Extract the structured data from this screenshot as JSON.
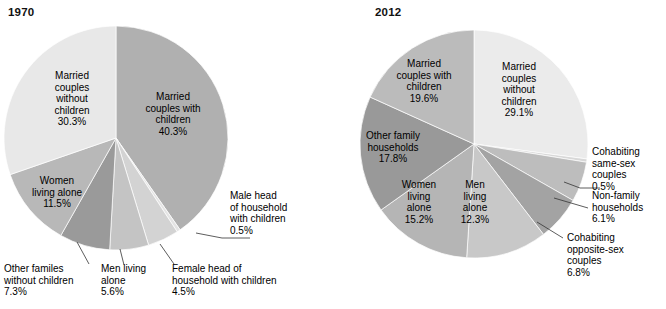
{
  "figure": {
    "background": "#ffffff",
    "text_color": "#000000"
  },
  "charts": [
    {
      "title": "1970",
      "title_pos": {
        "x": 8,
        "y": 16
      },
      "center": {
        "x": 116,
        "y": 138
      },
      "radius": 112,
      "start_angle_deg": -90
    },
    {
      "title": "2012",
      "title_pos": {
        "x": 375,
        "y": 16
      },
      "center": {
        "x": 474,
        "y": 144
      },
      "radius": 114,
      "start_angle_deg": -90
    }
  ],
  "chart_data": [
    {
      "type": "pie",
      "title": "1970",
      "unit": "%",
      "total": 100.0,
      "start_angle_deg": -90,
      "direction": "clockwise",
      "categories": [
        "Married couples with children",
        "Male head of household with children",
        "Female head of household with children",
        "Men living alone",
        "Other familes without children",
        "Women living alone",
        "Married couples without children"
      ],
      "values": [
        40.3,
        0.5,
        4.5,
        5.6,
        7.3,
        11.5,
        30.3
      ],
      "colors": [
        "#b0b0b0",
        "#e4e4e4",
        "#d3d3d3",
        "#c4c4c4",
        "#9a9a9a",
        "#b8b8b8",
        "#e8e8e8"
      ],
      "slices": [
        {
          "label": "Married couples with children",
          "value": 40.3,
          "value_text": "40.3%",
          "color": "#b0b0b0",
          "label_placement": "inside",
          "label_lines": [
            "Married",
            "couples with",
            "children",
            "40.3%"
          ],
          "label_pos": {
            "x": 173,
            "y": 100
          }
        },
        {
          "label": "Male head of household with children",
          "value": 0.5,
          "value_text": "0.5%",
          "color": "#e4e4e4",
          "label_placement": "outside",
          "label_lines": [
            "Male head",
            "of household",
            "with children",
            "0.5%"
          ],
          "label_pos": {
            "x": 230,
            "y": 199
          },
          "leader": [
            {
              "x": 196,
              "y": 233
            },
            {
              "x": 222,
              "y": 238
            },
            {
              "x": 250,
              "y": 238
            }
          ]
        },
        {
          "label": "Female head of household with children",
          "value": 4.5,
          "value_text": "4.5%",
          "color": "#d3d3d3",
          "label_placement": "outside",
          "label_lines": [
            "Female head of",
            "household with children",
            "4.5%"
          ],
          "label_pos": {
            "x": 172,
            "y": 272
          },
          "leader": [
            {
              "x": 160,
              "y": 244
            },
            {
              "x": 174,
              "y": 264
            }
          ]
        },
        {
          "label": "Men living alone",
          "value": 5.6,
          "value_text": "5.6%",
          "color": "#c4c4c4",
          "label_placement": "outside",
          "label_lines": [
            "Men living",
            "alone",
            "5.6%"
          ],
          "label_pos": {
            "x": 101,
            "y": 272
          },
          "leader": [
            {
              "x": 120,
              "y": 249
            },
            {
              "x": 124,
              "y": 265
            }
          ]
        },
        {
          "label": "Other familes without children",
          "value": 7.3,
          "value_text": "7.3%",
          "color": "#9a9a9a",
          "label_placement": "outside",
          "label_lines": [
            "Other familes",
            "without children",
            "7.3%"
          ],
          "label_pos": {
            "x": 4,
            "y": 272
          },
          "leader": [
            {
              "x": 77,
              "y": 242
            },
            {
              "x": 89,
              "y": 264
            }
          ]
        },
        {
          "label": "Women living alone",
          "value": 11.5,
          "value_text": "11.5%",
          "color": "#b8b8b8",
          "label_placement": "inside",
          "label_lines": [
            "Women",
            "living alone",
            "11.5%"
          ],
          "label_pos": {
            "x": 57,
            "y": 184
          }
        },
        {
          "label": "Married couples without children",
          "value": 30.3,
          "value_text": "30.3%",
          "color": "#e8e8e8",
          "label_placement": "inside",
          "label_lines": [
            "Married",
            "couples",
            "without",
            "children",
            "30.3%"
          ],
          "label_pos": {
            "x": 72,
            "y": 79
          }
        }
      ]
    },
    {
      "type": "pie",
      "title": "2012",
      "unit": "%",
      "total": 99.9,
      "start_angle_deg": -90,
      "direction": "clockwise",
      "categories": [
        "Married couples without children",
        "Cohabiting same-sex couples",
        "Non-family households",
        "Cohabiting opposite-sex couples",
        "Men living alone",
        "Women living alone",
        "Other family households",
        "Married couples with children"
      ],
      "values": [
        29.1,
        0.5,
        6.1,
        6.8,
        12.3,
        15.2,
        17.8,
        19.6
      ],
      "colors": [
        "#ebebeb",
        "#d8d8d8",
        "#bdbdbd",
        "#a3a3a3",
        "#c8c8c8",
        "#b5b5b5",
        "#999999",
        "#bbbbbb"
      ],
      "slices": [
        {
          "label": "Married couples without children",
          "value": 29.1,
          "value_text": "29.1%",
          "color": "#ebebeb",
          "label_placement": "inside",
          "label_lines": [
            "Married",
            "couples",
            "without",
            "children",
            "29.1%"
          ],
          "label_pos": {
            "x": 519,
            "y": 70
          }
        },
        {
          "label": "Cohabiting same-sex couples",
          "value": 0.5,
          "value_text": "0.5%",
          "color": "#d8d8d8",
          "label_placement": "outside",
          "label_lines": [
            "Cohabiting",
            "same-sex",
            "couples",
            "0.5%"
          ],
          "label_pos": {
            "x": 592,
            "y": 155
          },
          "leader": [
            {
              "x": 564,
              "y": 182
            },
            {
              "x": 580,
              "y": 188
            },
            {
              "x": 600,
              "y": 188
            }
          ]
        },
        {
          "label": "Non-family households",
          "value": 6.1,
          "value_text": "6.1%",
          "color": "#bdbdbd",
          "label_placement": "outside",
          "label_lines": [
            "Non-family",
            "households",
            "6.1%"
          ],
          "label_pos": {
            "x": 592,
            "y": 199
          },
          "leader": [
            {
              "x": 554,
              "y": 198
            },
            {
              "x": 588,
              "y": 208
            }
          ]
        },
        {
          "label": "Cohabiting opposite-sex couples",
          "value": 6.8,
          "value_text": "6.8%",
          "color": "#a3a3a3",
          "label_placement": "outside",
          "label_lines": [
            "Cohabiting",
            "opposite-sex",
            "couples",
            "6.8%"
          ],
          "label_pos": {
            "x": 567,
            "y": 241
          },
          "leader": [
            {
              "x": 537,
              "y": 222
            },
            {
              "x": 563,
              "y": 238
            }
          ]
        },
        {
          "label": "Men living alone",
          "value": 12.3,
          "value_text": "12.3%",
          "color": "#c8c8c8",
          "label_placement": "inside",
          "label_lines": [
            "Men",
            "living",
            "alone",
            "12.3%"
          ],
          "label_pos": {
            "x": 475,
            "y": 188
          }
        },
        {
          "label": "Women living alone",
          "value": 15.2,
          "value_text": "15.2%",
          "color": "#b5b5b5",
          "label_placement": "inside",
          "label_lines": [
            "Women",
            "living",
            "alone",
            "15.2%"
          ],
          "label_pos": {
            "x": 419,
            "y": 188
          }
        },
        {
          "label": "Other family households",
          "value": 17.8,
          "value_text": "17.8%",
          "color": "#999999",
          "label_placement": "inside",
          "label_lines": [
            "Other family",
            "households",
            "17.8%"
          ],
          "label_pos": {
            "x": 393,
            "y": 139
          }
        },
        {
          "label": "Married couples with children",
          "value": 19.6,
          "value_text": "19.6%",
          "color": "#bbbbbb",
          "label_placement": "inside",
          "label_lines": [
            "Married",
            "couples with",
            "children",
            "19.6%"
          ],
          "label_pos": {
            "x": 424,
            "y": 67
          }
        }
      ]
    }
  ]
}
